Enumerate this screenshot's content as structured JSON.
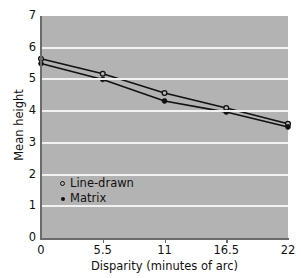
{
  "chart_data": {
    "type": "line",
    "title": "",
    "xlabel": "Disparity (minutes of arc)",
    "ylabel": "Mean height",
    "x": [
      0,
      5.5,
      11,
      16.5,
      22
    ],
    "xtick_labels": [
      "0",
      "5.5",
      "11",
      "16.5",
      "22"
    ],
    "ytick_labels": [
      "0",
      "1",
      "2",
      "3",
      "4",
      "5",
      "6",
      "7"
    ],
    "xlim": [
      0,
      22
    ],
    "ylim": [
      0,
      7
    ],
    "grid": "horizontal",
    "legend_position": "lower-left-inside",
    "plot_background": "#b3b3b3",
    "gridline_color": "#f2f2f2",
    "line_color": "#111111",
    "series": [
      {
        "name": "Line-drawn",
        "marker": "open-circle",
        "values": [
          5.65,
          5.18,
          4.57,
          4.1,
          3.6
        ]
      },
      {
        "name": "Matrix",
        "marker": "filled-circle",
        "values": [
          5.5,
          5.0,
          4.32,
          3.97,
          3.5
        ]
      }
    ]
  }
}
